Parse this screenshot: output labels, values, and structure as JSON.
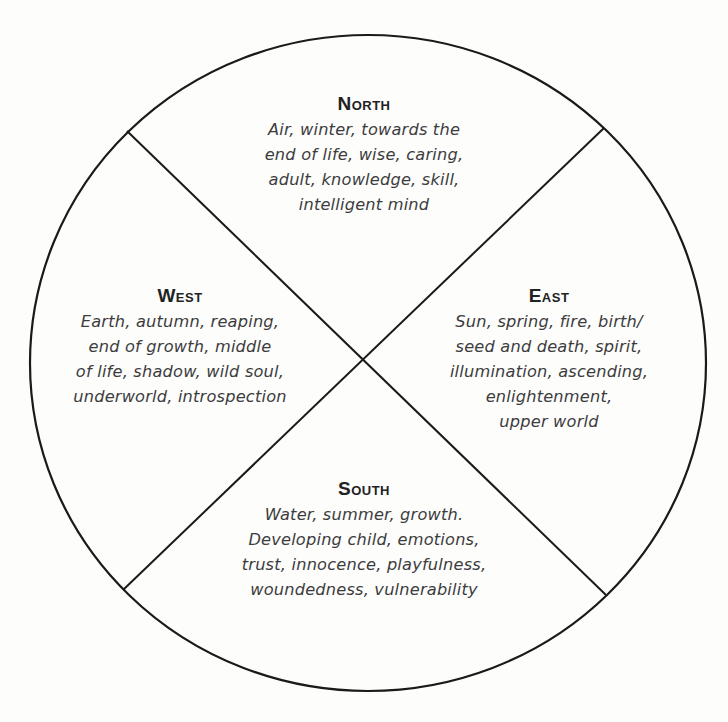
{
  "diagram": {
    "type": "medicine-wheel",
    "colors": {
      "background": "#fdfdfc",
      "line": "#1a1a1a",
      "title": "#222222",
      "text": "#3c3c3c"
    },
    "quadrants": {
      "north": {
        "title": "North",
        "lines": [
          "Air, winter, towards the",
          "end of life, wise, caring,",
          "adult, knowledge, skill,",
          "intelligent mind"
        ]
      },
      "west": {
        "title": "West",
        "lines": [
          "Earth, autumn, reaping,",
          "end of growth, middle",
          "of life, shadow, wild soul,",
          "underworld, introspection"
        ]
      },
      "east": {
        "title": "East",
        "lines": [
          "Sun, spring, fire, birth/",
          "seed and death, spirit,",
          "illumination, ascending,",
          "enlightenment,",
          "upper world"
        ]
      },
      "south": {
        "title": "South",
        "lines": [
          "Water, summer, growth.",
          "Developing child, emotions,",
          "trust, innocence, playfulness,",
          "woundedness, vulnerability"
        ]
      }
    }
  }
}
